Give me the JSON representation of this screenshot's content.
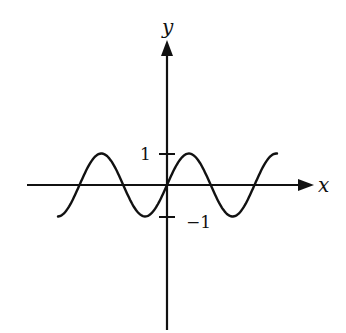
{
  "chart_data": {
    "type": "line",
    "title": "",
    "function": "y = sin(x)",
    "xlabel": "x",
    "ylabel": "y",
    "x_range_periods": [
      -2.5,
      2.5
    ],
    "x": [
      -7.85,
      -6.28,
      -4.71,
      -3.14,
      -1.57,
      0,
      1.57,
      3.14,
      4.71,
      6.28,
      7.85
    ],
    "values": [
      -1,
      0,
      1,
      0,
      -1,
      0,
      1,
      0,
      -1,
      0,
      1
    ],
    "ylim": [
      -1,
      1
    ],
    "y_ticks": [
      1,
      -1
    ],
    "y_tick_labels": [
      "1",
      "−1"
    ],
    "grid": false,
    "legend": null,
    "axes_arrows": true,
    "colors": {
      "curve": "#111111",
      "axes": "#111111",
      "background": "#ffffff"
    }
  },
  "labels": {
    "x_axis": "x",
    "y_axis": "y",
    "tick_pos": "1",
    "tick_neg": "−1"
  }
}
